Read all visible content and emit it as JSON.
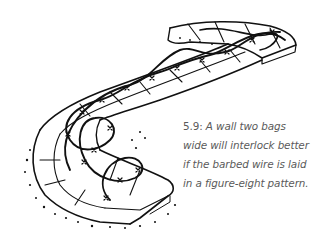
{
  "figure": {
    "illustration": "winding-earthbag-wall-with-barbed-wire",
    "ink_color": "#111111",
    "caption": {
      "number": "5.9:",
      "lines": [
        "A wall two bags",
        "wide will interlock better",
        "if the barbed wire is laid",
        "in a figure-eight pattern."
      ],
      "color": "#5a5a5a"
    }
  }
}
